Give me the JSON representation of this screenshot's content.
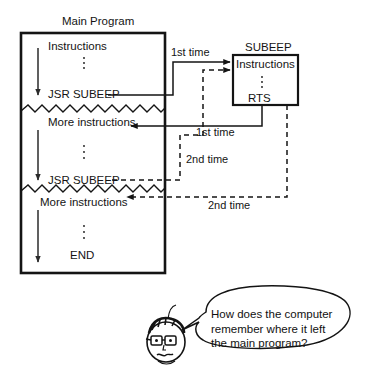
{
  "diagram": {
    "title": "Main Program",
    "main_program": {
      "label": "Main Program",
      "lines": [
        "Instructions",
        "JSR SUBEEP",
        "More instructions",
        "JSR SUBEEP",
        "More instructions",
        "END"
      ],
      "instructions_label": "Instructions",
      "jsr_first_label": "JSR SUBEEP",
      "more_first_label": "More instructions",
      "jsr_second_label": "JSR SUBEEP",
      "more_second_label": "More instructions",
      "end_label": "END",
      "vertical_dots": "⋮"
    },
    "subroutine": {
      "label": "SUBEEP",
      "instructions_label": "Instructions",
      "rts_label": "RTS",
      "vertical_dots": "⋮"
    },
    "flow_labels": {
      "call_first": "1st time",
      "return_first": "1st time",
      "call_second": "2nd time",
      "return_second": "2nd time"
    },
    "character": {
      "name": "cartoon-student",
      "question_lines": [
        "How does the computer",
        "remember where it left",
        "the main program?"
      ]
    },
    "colors": {
      "ink": "#141414",
      "line": "#1a1a1a",
      "background": "#ffffff"
    }
  }
}
